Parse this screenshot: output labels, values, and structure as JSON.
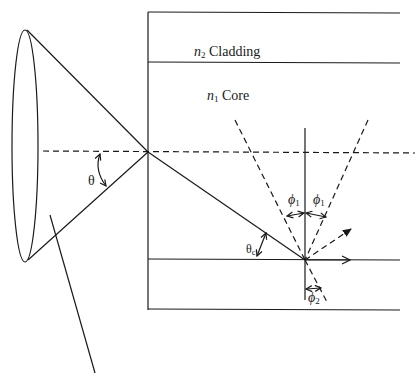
{
  "labels": {
    "cladding_index": "n",
    "cladding_index_sub": "2",
    "cladding_text": "Cladding",
    "core_index": "n",
    "core_index_sub": "1",
    "core_text": "Core",
    "acceptance_angle": "θ",
    "critical_angle": "θ",
    "critical_angle_sub": "c",
    "incidence_angle_left": "ϕ",
    "incidence_angle_left_sub": "1",
    "incidence_angle_right": "ϕ",
    "incidence_angle_right_sub": "1",
    "refraction_angle": "ϕ",
    "refraction_angle_sub": "2"
  },
  "colors": {
    "stroke": "#1a1a1a",
    "background": "#ffffff"
  }
}
